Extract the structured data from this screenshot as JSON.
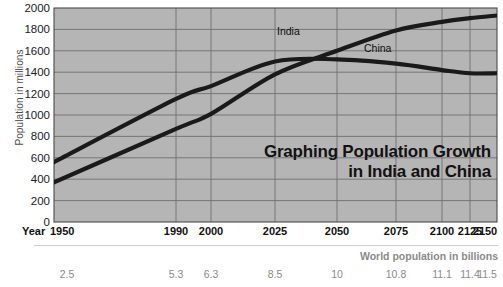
{
  "chart_data": {
    "type": "line",
    "title": "Graphing Population Growth",
    "subtitle": "in India and China",
    "xlabel": "Year",
    "ylabel": "Population in millions",
    "secondary_xlabel": "World population in billions",
    "ylim": [
      0,
      2000
    ],
    "ytick_step": 200,
    "grid": true,
    "legend_position": "inline",
    "yticks": [
      "2000",
      "1800",
      "1600",
      "1400",
      "1200",
      "1000",
      "800",
      "600",
      "400",
      "200",
      "0"
    ],
    "ytick_values": [
      2000,
      1800,
      1600,
      1400,
      1200,
      1000,
      800,
      600,
      400,
      200,
      0
    ],
    "categories": [
      "1950",
      "1990",
      "2000",
      "2025",
      "2050",
      "2075",
      "2100",
      "2125",
      "2150"
    ],
    "world_population_billions": [
      "2.5",
      "5.3",
      "6.3",
      "8.5",
      "10",
      "10.8",
      "11.1",
      "11.4",
      "11.5"
    ],
    "series": [
      {
        "name": "India",
        "values": [
          370,
          870,
          1010,
          1380,
          1600,
          1790,
          1870,
          1905,
          1930
        ]
      },
      {
        "name": "China",
        "values": [
          560,
          1150,
          1270,
          1500,
          1520,
          1480,
          1420,
          1390,
          1390
        ]
      }
    ]
  },
  "colors": {
    "plot_background": "#b5b5b5",
    "gridline": "#6f6f6f",
    "series_line": "#1a1a1a",
    "axis_text": "#101010",
    "muted_text": "#8a8a8a",
    "page_background": "#ffffff"
  }
}
